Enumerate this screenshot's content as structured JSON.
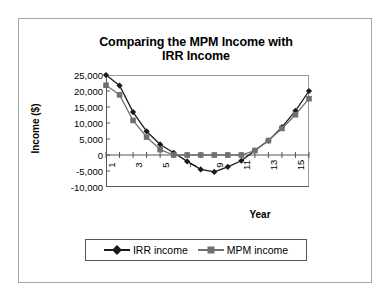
{
  "chart_data": {
    "type": "line",
    "title": "Comparing the MPM Income with IRR Income",
    "title_line1": "Comparing the MPM Income with",
    "title_line2": "IRR Income",
    "xlabel": "Year",
    "ylabel": "Income ($)",
    "x": [
      1,
      2,
      3,
      4,
      5,
      6,
      7,
      8,
      9,
      10,
      11,
      12,
      13,
      14,
      15,
      16
    ],
    "xlim": [
      1,
      16
    ],
    "ylim": [
      -10000,
      25000
    ],
    "ytick_values": [
      25000,
      20000,
      15000,
      10000,
      5000,
      0,
      -5000,
      -10000
    ],
    "ytick_labels": [
      "25,000",
      "20,000",
      "15,000",
      "10,000",
      "5,000",
      "0",
      "-5,000",
      "-10,000"
    ],
    "xtick_values": [
      1,
      3,
      5,
      7,
      9,
      11,
      13,
      15
    ],
    "xtick_labels": [
      "1",
      "3",
      "5",
      "7",
      "9",
      "11",
      "13",
      "15"
    ],
    "grid": false,
    "legend_position": "bottom",
    "series": [
      {
        "name": "IRR income",
        "marker": "diamond",
        "color": "#1a1a1a",
        "line_color": "#1a1a1a",
        "values": [
          25000,
          21700,
          13400,
          7400,
          3300,
          700,
          -2000,
          -4500,
          -5300,
          -3700,
          -1800,
          1400,
          4500,
          8700,
          13800,
          20000
        ]
      },
      {
        "name": "MPM income",
        "marker": "square",
        "color": "#707070",
        "line_color": "#707070",
        "values": [
          21800,
          18800,
          10800,
          5600,
          1700,
          0,
          0,
          0,
          0,
          0,
          0,
          1400,
          4500,
          8300,
          12600,
          17600
        ]
      }
    ]
  },
  "legend": {
    "entries": [
      {
        "label": "IRR income"
      },
      {
        "label": "MPM income"
      }
    ]
  },
  "colors": {
    "irr": "#1a1a1a",
    "mpm": "#707070",
    "axis": "#555555",
    "frame": "#a8a8a8"
  }
}
